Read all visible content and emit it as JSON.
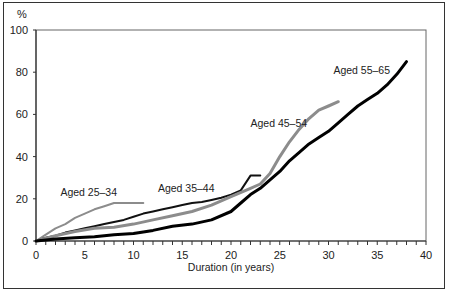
{
  "chart_data": {
    "type": "line",
    "title": "",
    "xlabel": "Duration (in years)",
    "ylabel": "%",
    "xlim": [
      0,
      40
    ],
    "ylim": [
      0,
      100
    ],
    "x_ticks": [
      0,
      5,
      10,
      15,
      20,
      25,
      30,
      35,
      40
    ],
    "y_ticks": [
      0,
      20,
      40,
      60,
      80,
      100
    ],
    "grid": false,
    "legend": "inline labels",
    "series": [
      {
        "name": "Aged 25–34",
        "color": "#8c8c8c",
        "width": 2,
        "x": [
          0,
          1,
          2,
          3,
          4,
          5,
          6,
          7,
          8,
          9,
          10,
          11
        ],
        "values": [
          0,
          3,
          6,
          8,
          11,
          13,
          15,
          16.5,
          18,
          18,
          18,
          18
        ]
      },
      {
        "name": "Aged 35–44",
        "color": "#111111",
        "width": 2,
        "x": [
          0,
          1,
          2,
          3,
          4,
          5,
          6,
          7,
          8,
          9,
          10,
          11,
          12,
          13,
          14,
          15,
          16,
          17,
          18,
          19,
          20,
          21,
          22,
          23
        ],
        "values": [
          0,
          1.5,
          2.5,
          4,
          5,
          6,
          7,
          8,
          9,
          10,
          11.5,
          13,
          14,
          15,
          16,
          17,
          18,
          18.5,
          19.5,
          20.5,
          22,
          24,
          31,
          31
        ]
      },
      {
        "name": "Aged 45–54",
        "color": "#8c8c8c",
        "width": 3,
        "x": [
          0,
          2,
          4,
          6,
          8,
          10,
          12,
          14,
          16,
          18,
          20,
          22,
          23,
          24,
          25,
          26,
          27,
          28,
          29,
          30,
          31
        ],
        "values": [
          0,
          2.5,
          4.5,
          6,
          6.5,
          8,
          10,
          12,
          14,
          17,
          21,
          25,
          27,
          32,
          40,
          47,
          53,
          58,
          62,
          64,
          66
        ]
      },
      {
        "name": "Aged 55–65",
        "color": "#000000",
        "width": 3,
        "x": [
          0,
          2,
          4,
          6,
          8,
          10,
          12,
          14,
          16,
          18,
          20,
          21,
          22,
          23,
          24,
          25,
          26,
          27,
          28,
          29,
          30,
          31,
          32,
          33,
          34,
          35,
          36,
          37,
          38
        ],
        "values": [
          0,
          1,
          1.5,
          2,
          3,
          3.5,
          5,
          7,
          8,
          10,
          14,
          18,
          22,
          25,
          29,
          33,
          38,
          42,
          46,
          49,
          52,
          56,
          60,
          64,
          67,
          70,
          74,
          79,
          85
        ]
      }
    ],
    "labels": [
      {
        "text": "Aged 25–34",
        "x": 2.5,
        "y": 21.5
      },
      {
        "text": "Aged 35–44",
        "x": 12.5,
        "y": 23
      },
      {
        "text": "Aged 45–54",
        "x": 22,
        "y": 54
      },
      {
        "text": "Aged 55–65",
        "x": 30.5,
        "y": 79
      }
    ]
  },
  "axis": {
    "y_unit": "%",
    "x_title": "Duration (in years)"
  }
}
